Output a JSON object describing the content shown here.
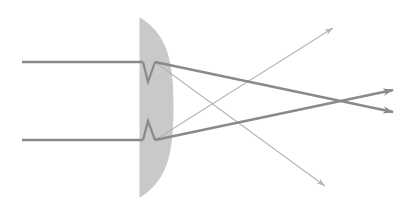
{
  "figure": {
    "name": "plano-convex-lens-ray-diagram",
    "title": "Plano-convex lens refraction ray diagram",
    "background_color": "#ffffff",
    "width": 410,
    "height": 214,
    "border": "none"
  },
  "colors": {
    "lens_fill": "#c9c9c9",
    "lens_stroke": "#c9c9c9",
    "ray_strong": "#8a8a8a",
    "ray_faint": "#b5b5b5",
    "background": "#ffffff"
  },
  "lens": {
    "label": "plano-convex lens",
    "flat_face_x": 140,
    "top_y": 18,
    "bottom_y": 197,
    "apex_x": 173,
    "apex_y": 107,
    "fill": "#c9c9c9",
    "orientation": "flat-left-convex-right"
  },
  "rays": [
    {
      "name": "incoming-ray-upper",
      "kind": "incident",
      "weight": "strong",
      "points": [
        [
          22,
          62
        ],
        [
          143,
          62
        ]
      ],
      "arrow": false
    },
    {
      "name": "incoming-ray-lower",
      "kind": "incident",
      "weight": "strong",
      "points": [
        [
          22,
          140
        ],
        [
          143,
          140
        ]
      ],
      "arrow": false
    },
    {
      "name": "internal-ray-upper",
      "kind": "internal",
      "weight": "strong",
      "points": [
        [
          143,
          62
        ],
        [
          148,
          82
        ],
        [
          155,
          62
        ]
      ],
      "arrow": false
    },
    {
      "name": "internal-ray-lower",
      "kind": "internal",
      "weight": "strong",
      "points": [
        [
          143,
          140
        ],
        [
          148,
          121
        ],
        [
          155,
          140
        ]
      ],
      "arrow": false
    },
    {
      "name": "refracted-ray-upper-to-focus",
      "kind": "refracted",
      "weight": "strong",
      "points": [
        [
          155,
          62
        ],
        [
          393,
          112
        ]
      ],
      "arrow": true,
      "arrow_at": [
        393,
        112
      ]
    },
    {
      "name": "refracted-ray-lower-to-focus",
      "kind": "refracted",
      "weight": "strong",
      "points": [
        [
          155,
          140
        ],
        [
          393,
          90
        ]
      ],
      "arrow": true,
      "arrow_at": [
        393,
        90
      ]
    },
    {
      "name": "stray-ray-upper-right",
      "kind": "reflected",
      "weight": "faint",
      "points": [
        [
          155,
          140
        ],
        [
          333,
          28
        ]
      ],
      "arrow": true,
      "arrow_at": [
        333,
        28
      ]
    },
    {
      "name": "stray-ray-lower-right",
      "kind": "reflected",
      "weight": "faint",
      "points": [
        [
          155,
          62
        ],
        [
          325,
          186
        ]
      ],
      "arrow": true,
      "arrow_at": [
        325,
        186
      ]
    }
  ],
  "focus": {
    "name": "crossing-point",
    "x": 340,
    "y": 101,
    "label": "ray crossing / focal region"
  },
  "chart_data": {
    "type": "diagram",
    "title": "Plano-convex lens refraction ray diagram",
    "elements": [
      "plano-convex lens",
      "two parallel incident rays",
      "two refracted converging rays with arrowheads",
      "two faint diverging stray rays with arrowheads",
      "ray crossing point right of lens"
    ]
  }
}
